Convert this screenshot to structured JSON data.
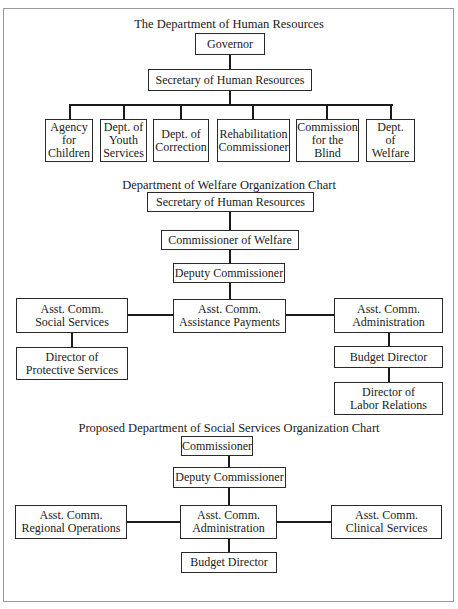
{
  "charts": [
    {
      "title": "The Department of Human Resources",
      "nodes": {
        "governor": "Governor",
        "secretary": "Secretary of Human Resources",
        "children": [
          "Agency\nfor\nChildren",
          "Dept. of\nYouth\nServices",
          "Dept. of\nCorrection",
          "Rehabilitation\nCommissioner",
          "Commission\nfor the\nBlind",
          "Dept.\nof\nWelfare"
        ]
      }
    },
    {
      "title": "Department of Welfare Organization Chart",
      "nodes": {
        "secretary": "Secretary of Human Resources",
        "commissioner": "Commissioner of Welfare",
        "deputy": "Deputy Commissioner",
        "social_services": "Asst. Comm.\nSocial Services",
        "assistance_payments": "Asst. Comm.\nAssistance Payments",
        "administration": "Asst. Comm.\nAdministration",
        "protective_services": "Director of\nProtective Services",
        "budget": "Budget Director",
        "labor_relations": "Director of\nLabor Relations"
      }
    },
    {
      "title": "Proposed Department of Social Services Organization Chart",
      "nodes": {
        "commissioner": "Commissioner",
        "deputy": "Deputy Commissioner",
        "regional_operations": "Asst. Comm.\nRegional Operations",
        "administration": "Asst. Comm.\nAdministration",
        "clinical_services": "Asst. Comm.\nClinical Services",
        "budget": "Budget Director"
      }
    }
  ]
}
